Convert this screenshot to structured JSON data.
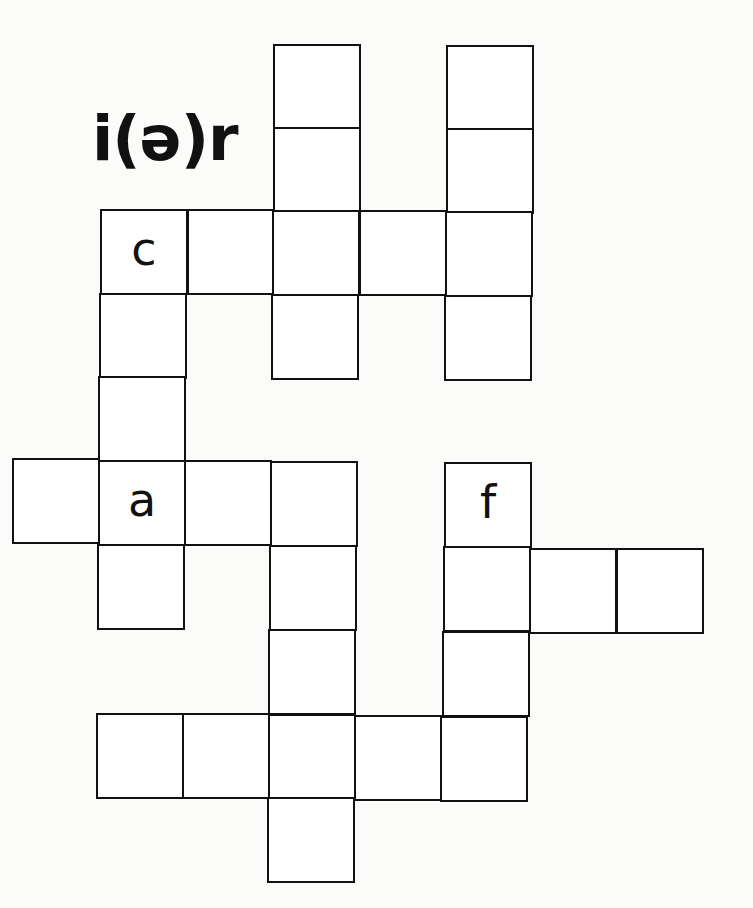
{
  "title": "i(ə)r",
  "grid": {
    "cell_size": 86,
    "cells": [
      {
        "id": "r0c3",
        "x": 273,
        "y": 44,
        "letter": ""
      },
      {
        "id": "r0c5",
        "x": 446,
        "y": 45,
        "letter": ""
      },
      {
        "id": "r1c3",
        "x": 273,
        "y": 127,
        "letter": ""
      },
      {
        "id": "r1c5",
        "x": 446,
        "y": 128,
        "letter": ""
      },
      {
        "id": "r2c1",
        "x": 100,
        "y": 209,
        "letter": "c"
      },
      {
        "id": "r2c2",
        "x": 187,
        "y": 209,
        "letter": ""
      },
      {
        "id": "r2c3",
        "x": 272,
        "y": 210,
        "letter": ""
      },
      {
        "id": "r2c4",
        "x": 359,
        "y": 210,
        "letter": ""
      },
      {
        "id": "r2c5",
        "x": 445,
        "y": 211,
        "letter": ""
      },
      {
        "id": "r3c1",
        "x": 99,
        "y": 293,
        "letter": ""
      },
      {
        "id": "r3c3",
        "x": 271,
        "y": 294,
        "letter": ""
      },
      {
        "id": "r3c5",
        "x": 444,
        "y": 295,
        "letter": ""
      },
      {
        "id": "r4c1",
        "x": 98,
        "y": 376,
        "letter": ""
      },
      {
        "id": "r5c0",
        "x": 12,
        "y": 458,
        "letter": ""
      },
      {
        "id": "r5c1",
        "x": 98,
        "y": 460,
        "letter": "a"
      },
      {
        "id": "r5c2",
        "x": 184,
        "y": 460,
        "letter": ""
      },
      {
        "id": "r5c3",
        "x": 270,
        "y": 461,
        "letter": ""
      },
      {
        "id": "r5c5",
        "x": 444,
        "y": 462,
        "letter": "f"
      },
      {
        "id": "r6c1",
        "x": 97,
        "y": 544,
        "letter": ""
      },
      {
        "id": "r6c3",
        "x": 269,
        "y": 545,
        "letter": ""
      },
      {
        "id": "r6c5",
        "x": 443,
        "y": 546,
        "letter": ""
      },
      {
        "id": "r6c6",
        "x": 529,
        "y": 548,
        "letter": ""
      },
      {
        "id": "r6c7",
        "x": 616,
        "y": 548,
        "letter": ""
      },
      {
        "id": "r7c3",
        "x": 268,
        "y": 629,
        "letter": ""
      },
      {
        "id": "r7c5",
        "x": 442,
        "y": 631,
        "letter": ""
      },
      {
        "id": "r8c1",
        "x": 96,
        "y": 713,
        "letter": ""
      },
      {
        "id": "r8c2",
        "x": 182,
        "y": 713,
        "letter": ""
      },
      {
        "id": "r8c3",
        "x": 268,
        "y": 714,
        "letter": ""
      },
      {
        "id": "r8c4",
        "x": 354,
        "y": 715,
        "letter": ""
      },
      {
        "id": "r8c5",
        "x": 440,
        "y": 716,
        "letter": ""
      },
      {
        "id": "r9c3",
        "x": 267,
        "y": 797,
        "letter": ""
      }
    ]
  }
}
